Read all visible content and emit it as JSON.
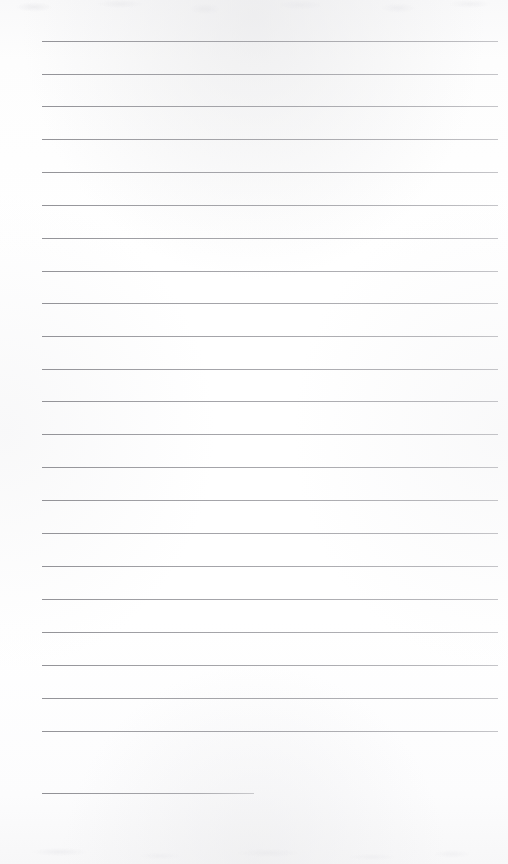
{
  "document": {
    "kind": "blank-lined-page",
    "description": "Scanned blank ruled notebook page with no written content",
    "width": 508,
    "height": 864,
    "background_color": "#fcfcfc",
    "rule_color": "#9a9a9f",
    "rule_thickness": 1,
    "text_content": "",
    "visible_text": []
  },
  "ruling": {
    "line_left": 42,
    "line_right": 498,
    "first_line_y": 41,
    "line_spacing": 32.9,
    "full_line_count": 22,
    "short_line_count": 1,
    "lines": [
      {
        "id": 1,
        "y": 41,
        "x1": 42,
        "x2": 498,
        "type": "full",
        "content": ""
      },
      {
        "id": 2,
        "y": 74,
        "x1": 42,
        "x2": 498,
        "type": "full",
        "content": ""
      },
      {
        "id": 3,
        "y": 106,
        "x1": 42,
        "x2": 498,
        "type": "full",
        "content": ""
      },
      {
        "id": 4,
        "y": 139,
        "x1": 42,
        "x2": 498,
        "type": "full",
        "content": ""
      },
      {
        "id": 5,
        "y": 172,
        "x1": 42,
        "x2": 498,
        "type": "full",
        "content": ""
      },
      {
        "id": 6,
        "y": 205,
        "x1": 42,
        "x2": 498,
        "type": "full",
        "content": ""
      },
      {
        "id": 7,
        "y": 238,
        "x1": 42,
        "x2": 498,
        "type": "full",
        "content": ""
      },
      {
        "id": 8,
        "y": 271,
        "x1": 42,
        "x2": 498,
        "type": "full",
        "content": ""
      },
      {
        "id": 9,
        "y": 303,
        "x1": 42,
        "x2": 498,
        "type": "full",
        "content": ""
      },
      {
        "id": 10,
        "y": 336,
        "x1": 42,
        "x2": 498,
        "type": "full",
        "content": ""
      },
      {
        "id": 11,
        "y": 369,
        "x1": 42,
        "x2": 498,
        "type": "full",
        "content": ""
      },
      {
        "id": 12,
        "y": 401,
        "x1": 42,
        "x2": 498,
        "type": "full",
        "content": ""
      },
      {
        "id": 13,
        "y": 434,
        "x1": 42,
        "x2": 498,
        "type": "full",
        "content": ""
      },
      {
        "id": 14,
        "y": 467,
        "x1": 42,
        "x2": 498,
        "type": "full",
        "content": ""
      },
      {
        "id": 15,
        "y": 500,
        "x1": 42,
        "x2": 498,
        "type": "full",
        "content": ""
      },
      {
        "id": 16,
        "y": 533,
        "x1": 42,
        "x2": 498,
        "type": "full",
        "content": ""
      },
      {
        "id": 17,
        "y": 566,
        "x1": 42,
        "x2": 498,
        "type": "full",
        "content": ""
      },
      {
        "id": 18,
        "y": 599,
        "x1": 42,
        "x2": 498,
        "type": "full",
        "content": ""
      },
      {
        "id": 19,
        "y": 632,
        "x1": 42,
        "x2": 498,
        "type": "full",
        "content": ""
      },
      {
        "id": 20,
        "y": 665,
        "x1": 42,
        "x2": 498,
        "type": "full",
        "content": ""
      },
      {
        "id": 21,
        "y": 698,
        "x1": 42,
        "x2": 498,
        "type": "full",
        "content": ""
      },
      {
        "id": 22,
        "y": 731,
        "x1": 42,
        "x2": 498,
        "type": "full",
        "content": ""
      },
      {
        "id": 23,
        "y": 793,
        "x1": 42,
        "x2": 254,
        "type": "short",
        "content": ""
      }
    ]
  }
}
